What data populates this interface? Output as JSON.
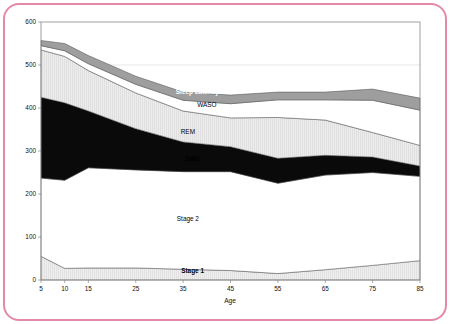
{
  "figure": {
    "frame_color": "#e58aa6",
    "background": "#ffffff"
  },
  "chart_data": {
    "type": "area",
    "stacked": true,
    "title": "",
    "subtitle": "",
    "xlabel": "Age",
    "ylabel": "",
    "xlim": [
      5,
      85
    ],
    "ylim": [
      0,
      600
    ],
    "grid": true,
    "grid_lines_y": [
      500
    ],
    "legend_position": "inline-annotations",
    "x": [
      5,
      10,
      15,
      25,
      35,
      45,
      55,
      65,
      75,
      85
    ],
    "xticks": [
      "5",
      "10",
      "15",
      "25",
      "35",
      "45",
      "55",
      "65",
      "75",
      "85"
    ],
    "yticks": [
      "0",
      "100",
      "200",
      "300",
      "400",
      "500",
      "600"
    ],
    "ytick_values": [
      0,
      100,
      200,
      300,
      400,
      500,
      600
    ],
    "units": "minutes",
    "series": [
      {
        "name": "Stage 1",
        "label": "Stage 1",
        "fill": "#e9e9e9",
        "label_color": "#000000",
        "order": 1,
        "values": [
          55,
          27,
          28,
          28,
          25,
          22,
          15,
          24,
          34,
          45
        ]
      },
      {
        "name": "Stage 2",
        "label": "Stage 2",
        "fill": "#ffffff",
        "label_color": "#000000",
        "order": 2,
        "values": [
          182,
          205,
          233,
          228,
          227,
          230,
          210,
          220,
          216,
          196
        ],
        "cumulative_top": [
          237,
          232,
          261,
          256,
          252,
          252,
          225,
          244,
          250,
          241
        ]
      },
      {
        "name": "SWS",
        "label": "SWS",
        "fill": "#0a0a0a",
        "label_color": "#ffffff",
        "order": 3,
        "values": [
          188,
          180,
          132,
          96,
          69,
          58,
          58,
          46,
          36,
          24
        ],
        "cumulative_top": [
          425,
          412,
          393,
          352,
          321,
          310,
          283,
          290,
          286,
          265
        ]
      },
      {
        "name": "REM",
        "label": "REM",
        "fill": "#ededed",
        "label_color": "#000000",
        "order": 4,
        "values": [
          110,
          108,
          94,
          83,
          72,
          67,
          95,
          82,
          57,
          48
        ],
        "cumulative_top": [
          535,
          520,
          487,
          435,
          393,
          377,
          378,
          372,
          343,
          313
        ]
      },
      {
        "name": "WASO",
        "label": "WASO",
        "fill": "#ffffff",
        "label_color": "#000000",
        "order": 5,
        "values": [
          10,
          13,
          16,
          20,
          25,
          33,
          41,
          47,
          75,
          82
        ],
        "cumulative_top": [
          545,
          533,
          503,
          455,
          418,
          410,
          419,
          419,
          418,
          395
        ]
      },
      {
        "name": "Sleep Latency",
        "label": "Sleep Latency",
        "fill": "#9e9e9e",
        "label_color": "#ffffff",
        "order": 6,
        "values": [
          12,
          17,
          19,
          19,
          19,
          20,
          18,
          18,
          26,
          28
        ],
        "cumulative_top": [
          557,
          550,
          522,
          474,
          437,
          430,
          437,
          437,
          444,
          423
        ]
      }
    ],
    "annotations": [
      {
        "text": "Sleep Latency",
        "x": 38,
        "y": 432,
        "color": "#ffffff"
      },
      {
        "text": "WASO",
        "x": 40,
        "y": 402,
        "color": "#000000"
      },
      {
        "text": "REM",
        "x": 36,
        "y": 340,
        "color": "#000000"
      },
      {
        "text": "SWS",
        "x": 37,
        "y": 276,
        "color": "#000000"
      },
      {
        "text": "Stage 2",
        "x": 36,
        "y": 138,
        "color": "#000000"
      },
      {
        "text": "Stage 1",
        "x": 37,
        "y": 17,
        "color": "#000000"
      }
    ]
  }
}
